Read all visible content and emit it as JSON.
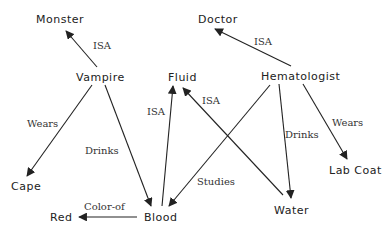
{
  "diagram": {
    "type": "semantic-network",
    "nodes": [
      {
        "id": "monster",
        "label": "Monster"
      },
      {
        "id": "vampire",
        "label": "Vampire"
      },
      {
        "id": "doctor",
        "label": "Doctor"
      },
      {
        "id": "hematologist",
        "label": "Hematologist"
      },
      {
        "id": "fluid",
        "label": "Fluid"
      },
      {
        "id": "cape",
        "label": "Cape"
      },
      {
        "id": "lab_coat",
        "label": "Lab Coat"
      },
      {
        "id": "red",
        "label": "Red"
      },
      {
        "id": "blood",
        "label": "Blood"
      },
      {
        "id": "water",
        "label": "Water"
      }
    ],
    "edges": [
      {
        "from": "vampire",
        "to": "monster",
        "label": "ISA"
      },
      {
        "from": "hematologist",
        "to": "doctor",
        "label": "ISA"
      },
      {
        "from": "vampire",
        "to": "cape",
        "label": "Wears"
      },
      {
        "from": "vampire",
        "to": "blood",
        "label": "Drinks"
      },
      {
        "from": "blood",
        "to": "fluid",
        "label": "ISA"
      },
      {
        "from": "water",
        "to": "fluid",
        "label": "ISA"
      },
      {
        "from": "hematologist",
        "to": "blood",
        "label": "Studies"
      },
      {
        "from": "hematologist",
        "to": "water",
        "label": "Drinks"
      },
      {
        "from": "hematologist",
        "to": "lab_coat",
        "label": "Wears"
      },
      {
        "from": "blood",
        "to": "red",
        "label": "Color-of"
      }
    ]
  }
}
